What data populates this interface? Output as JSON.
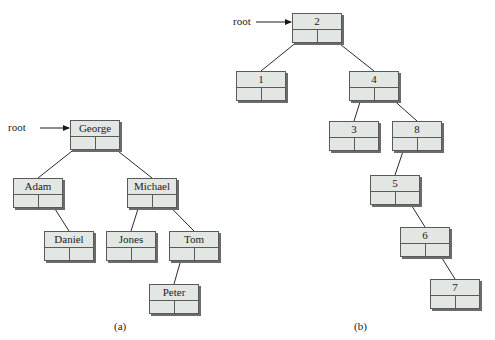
{
  "colors": {
    "node_fill": "#e3e7e3",
    "node_border": "#5a5a5a",
    "edge": "#2a2a2a",
    "background": "#ffffff"
  },
  "diagrams": [
    {
      "id": "a",
      "caption": "(a)",
      "root_label": "root",
      "root_arrow": {
        "x1": 40,
        "y1": 128,
        "x2": 70,
        "y2": 128,
        "label_x": 8,
        "label_y": 121
      },
      "caption_pos": {
        "x": 114,
        "y": 320
      },
      "nodes": [
        {
          "key": "george",
          "label": "George",
          "x": 70,
          "y": 120
        },
        {
          "key": "adam",
          "label": "Adam",
          "x": 13,
          "y": 178
        },
        {
          "key": "michael",
          "label": "Michael",
          "x": 127,
          "y": 178
        },
        {
          "key": "daniel",
          "label": "Daniel",
          "x": 44,
          "y": 231
        },
        {
          "key": "jones",
          "label": "Jones",
          "x": 106,
          "y": 231
        },
        {
          "key": "tom",
          "label": "Tom",
          "x": 169,
          "y": 231
        },
        {
          "key": "peter",
          "label": "Peter",
          "x": 149,
          "y": 284
        }
      ],
      "edges": [
        {
          "from": "george",
          "side": "left",
          "to": "adam"
        },
        {
          "from": "george",
          "side": "right",
          "to": "michael"
        },
        {
          "from": "adam",
          "side": "right",
          "to": "daniel"
        },
        {
          "from": "michael",
          "side": "left",
          "to": "jones"
        },
        {
          "from": "michael",
          "side": "right",
          "to": "tom"
        },
        {
          "from": "tom",
          "side": "left",
          "to": "peter"
        }
      ]
    },
    {
      "id": "b",
      "caption": "(b)",
      "root_label": "root",
      "root_arrow": {
        "x1": 256,
        "y1": 22,
        "x2": 292,
        "y2": 22,
        "label_x": 233,
        "label_y": 15
      },
      "caption_pos": {
        "x": 354,
        "y": 320
      },
      "nodes": [
        {
          "key": "n2",
          "label": "2",
          "x": 292,
          "y": 13
        },
        {
          "key": "n1",
          "label": "1",
          "x": 236,
          "y": 71
        },
        {
          "key": "n4",
          "label": "4",
          "x": 349,
          "y": 71
        },
        {
          "key": "n3",
          "label": "3",
          "x": 329,
          "y": 121
        },
        {
          "key": "n8",
          "label": "8",
          "x": 392,
          "y": 121
        },
        {
          "key": "n5",
          "label": "5",
          "x": 370,
          "y": 175
        },
        {
          "key": "n6",
          "label": "6",
          "x": 400,
          "y": 227
        },
        {
          "key": "n7",
          "label": "7",
          "x": 430,
          "y": 279
        }
      ],
      "edges": [
        {
          "from": "n2",
          "side": "left",
          "to": "n1"
        },
        {
          "from": "n2",
          "side": "right",
          "to": "n4"
        },
        {
          "from": "n4",
          "side": "left",
          "to": "n3"
        },
        {
          "from": "n4",
          "side": "right",
          "to": "n8"
        },
        {
          "from": "n8",
          "side": "left",
          "to": "n5"
        },
        {
          "from": "n5",
          "side": "right",
          "to": "n6"
        },
        {
          "from": "n6",
          "side": "right",
          "to": "n7"
        }
      ]
    }
  ]
}
